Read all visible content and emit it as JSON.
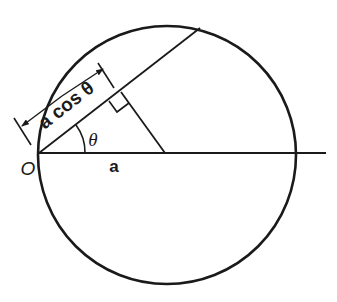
{
  "diagram": {
    "type": "geometry",
    "labels": {
      "origin": "O",
      "radius": "a",
      "angle": "θ",
      "chord_length": "a cos θ"
    },
    "colors": {
      "ink": "#1a1a1a",
      "background": "#ffffff"
    },
    "elements": [
      "circle through origin O with center on horizontal axis",
      "horizontal line from O through center extending past circle",
      "chord from O at angle θ above horizontal",
      "perpendicular from circle center to chord with right-angle marker",
      "dimension line with arrows labeled a cos θ along chord",
      "angle arc θ at O"
    ]
  }
}
